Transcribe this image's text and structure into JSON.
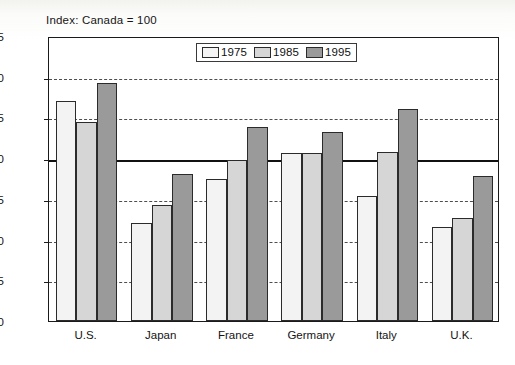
{
  "chart_data": {
    "type": "bar",
    "title": "Index: Canada = 100",
    "xlabel": "",
    "ylabel": "",
    "ylim": [
      0,
      175
    ],
    "yticks": [
      0,
      25,
      50,
      75,
      100,
      125,
      150,
      175
    ],
    "ytick_labels": [
      "0",
      "25",
      "50",
      "75",
      "100",
      "125",
      "150",
      "175"
    ],
    "grid": true,
    "gridlines": [
      25,
      50,
      75,
      125,
      150
    ],
    "reference_line": 100,
    "legend_position": "top-center",
    "categories": [
      "U.S.",
      "Japan",
      "France",
      "Germany",
      "Italy",
      "U.K."
    ],
    "series": [
      {
        "name": "1975",
        "color": "#f3f3f3",
        "values": [
          135,
          60,
          87,
          103,
          77,
          58
        ]
      },
      {
        "name": "1985",
        "color": "#d6d6d6",
        "values": [
          122,
          71,
          99,
          103,
          104,
          63
        ]
      },
      {
        "name": "1995",
        "color": "#9a9a9a",
        "values": [
          146,
          90,
          119,
          116,
          130,
          89
        ]
      }
    ]
  },
  "legend": {
    "items": [
      {
        "label": "1975"
      },
      {
        "label": "1985"
      },
      {
        "label": "1995"
      }
    ]
  },
  "colors": {
    "series_1975": "#f3f3f3",
    "series_1985": "#d6d6d6",
    "series_1995": "#9a9a9a",
    "axis": "#1a1a1a",
    "gridline": "#4d4d4d",
    "reference_line": "#111111",
    "text": "#141414"
  }
}
